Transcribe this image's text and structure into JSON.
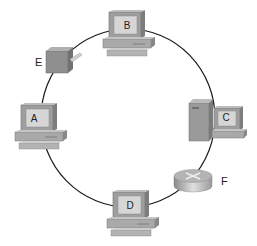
{
  "diagram": {
    "type": "ring-topology",
    "nodes": [
      {
        "id": "B",
        "label": "B",
        "kind": "workstation"
      },
      {
        "id": "E",
        "label": "E",
        "kind": "transceiver"
      },
      {
        "id": "A",
        "label": "A",
        "kind": "workstation"
      },
      {
        "id": "C",
        "label": "C",
        "kind": "server-workstation"
      },
      {
        "id": "F",
        "label": "F",
        "kind": "router"
      },
      {
        "id": "D",
        "label": "D",
        "kind": "workstation"
      }
    ],
    "connections": "ring",
    "colors": {
      "line": "#1a1a1a",
      "device_body": "#a9a9a9",
      "device_dark": "#7d7d7d",
      "screen": "#d6d6d6"
    }
  }
}
